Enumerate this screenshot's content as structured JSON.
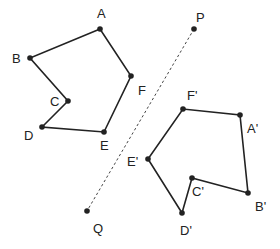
{
  "diagram": {
    "mirror_line": {
      "label_start": "P",
      "label_end": "Q",
      "P": [
        194,
        29
      ],
      "Q": [
        87,
        211
      ],
      "style": "dashed"
    },
    "original": {
      "vertices": [
        {
          "name": "A",
          "x": 100,
          "y": 29,
          "lx": 97,
          "ly": 18
        },
        {
          "name": "B",
          "x": 30,
          "y": 58,
          "lx": 12,
          "ly": 63
        },
        {
          "name": "C",
          "x": 68,
          "y": 101,
          "lx": 50,
          "ly": 106
        },
        {
          "name": "D",
          "x": 42,
          "y": 127,
          "lx": 24,
          "ly": 140
        },
        {
          "name": "E",
          "x": 104,
          "y": 132,
          "lx": 100,
          "ly": 150
        },
        {
          "name": "F",
          "x": 131,
          "y": 76,
          "lx": 138,
          "ly": 95
        }
      ]
    },
    "image": {
      "vertices": [
        {
          "name": "A'",
          "x": 240,
          "y": 115,
          "lx": 247,
          "ly": 133
        },
        {
          "name": "B'",
          "x": 248,
          "y": 193,
          "lx": 255,
          "ly": 211
        },
        {
          "name": "C'",
          "x": 192,
          "y": 178,
          "lx": 192,
          "ly": 196
        },
        {
          "name": "D'",
          "x": 182,
          "y": 213,
          "lx": 180,
          "ly": 235
        },
        {
          "name": "E'",
          "x": 148,
          "y": 159,
          "lx": 127,
          "ly": 166
        },
        {
          "name": "F'",
          "x": 183,
          "y": 109,
          "lx": 187,
          "ly": 100
        }
      ]
    },
    "point_labels": {
      "P": {
        "lx": 196,
        "ly": 22
      },
      "Q": {
        "lx": 93,
        "ly": 233
      }
    }
  }
}
